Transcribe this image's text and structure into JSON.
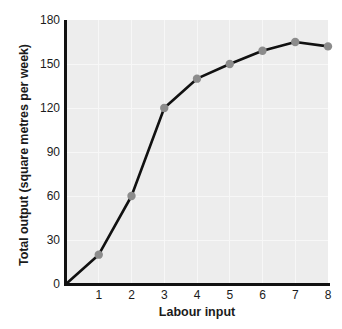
{
  "chart_data": {
    "type": "line",
    "title": "",
    "xlabel": "Labour input",
    "ylabel": "Total output (square metres per week)",
    "x": [
      0,
      1,
      2,
      3,
      4,
      5,
      6,
      7,
      8
    ],
    "values": [
      0,
      20,
      60,
      120,
      140,
      150,
      159,
      165,
      162
    ],
    "series": [
      {
        "name": "Total output",
        "values": [
          0,
          20,
          60,
          120,
          140,
          150,
          159,
          165,
          162
        ]
      }
    ],
    "xticks": [
      "1",
      "2",
      "3",
      "4",
      "5",
      "6",
      "7",
      "8"
    ],
    "xtick_values": [
      1,
      2,
      3,
      4,
      5,
      6,
      7,
      8
    ],
    "yticks": [
      "0",
      "30",
      "60",
      "90",
      "120",
      "150",
      "180"
    ],
    "ytick_values": [
      0,
      30,
      60,
      90,
      120,
      150,
      180
    ],
    "xlim": [
      0,
      8
    ],
    "ylim": [
      0,
      180
    ],
    "grid": true,
    "legend": "none",
    "marker_points": [
      1,
      2,
      3,
      4,
      5,
      6,
      7,
      8
    ],
    "colors": {
      "plot_background": "#ededed",
      "gridline": "#f7f7f7",
      "line": "#111111",
      "marker": "#8c8c8c",
      "axis": "#111111",
      "text": "#1b1b1b",
      "page_background": "#ffffff"
    }
  },
  "axis": {
    "x_title": "Labour input",
    "y_title": "Total output (square metres per week)"
  }
}
